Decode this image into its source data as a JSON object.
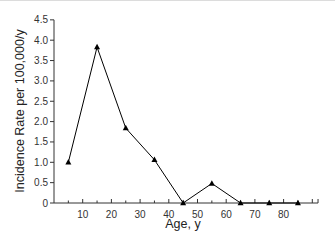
{
  "chart_data": {
    "type": "line",
    "title": "",
    "xlabel": "Age, y",
    "ylabel": "Incidence Rate per 100,000/y",
    "x": [
      5,
      15,
      25,
      35,
      45,
      55,
      65,
      75,
      85
    ],
    "series": [
      {
        "name": "Incidence Rate",
        "values": [
          1.0,
          3.83,
          1.84,
          1.06,
          0.0,
          0.48,
          0.0,
          0.0,
          0.0
        ],
        "marker": "triangle",
        "color": "#000000"
      }
    ],
    "xticks": [
      10,
      20,
      30,
      40,
      50,
      60,
      70,
      80
    ],
    "yticks": [
      0,
      0.5,
      1.0,
      1.5,
      2.0,
      2.5,
      3.0,
      3.5,
      4.0,
      4.5
    ],
    "ytick_labels": [
      "0",
      "0.5",
      "1.0",
      "1.5",
      "2.0",
      "2.5",
      "3.0",
      "3.5",
      "4.0",
      "4.5"
    ],
    "xlim": [
      0,
      92
    ],
    "ylim": [
      0,
      4.5
    ],
    "grid": false,
    "legend": null
  }
}
